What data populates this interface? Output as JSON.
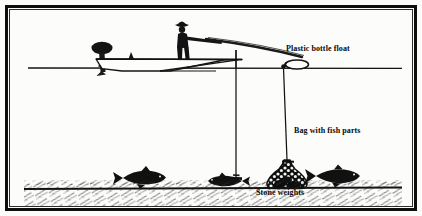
{
  "figure": {
    "domain": "diagram",
    "background_color": "#fcfcfa",
    "ink_color": "#101010",
    "frame": {
      "outer_color": "#0d0d0d",
      "inner_color": "#2a2a2a"
    }
  },
  "labels": {
    "float": "Plastic bottle float",
    "bag": "Bag with fish parts",
    "stones": "Stone weights"
  },
  "elements": {
    "boat": "fishing-boat",
    "angler": "standing-angler-with-hat",
    "motor": "outboard-motor",
    "rod": "fishing-rod",
    "fishing_line": "vertical-fishing-line",
    "hook_weight": "hook-with-small-weight",
    "float": "plastic-bottle-float",
    "mooring_line": "bag-tether-line",
    "bag": "mesh-bag-with-fish-parts",
    "stone_weights": "stone-weights-in-bag",
    "water_surface": "water-surface-line",
    "seabed": "hatched-seabed",
    "fish": [
      "fish-left",
      "fish-center",
      "fish-right"
    ]
  },
  "geometry": {
    "water_surface_y": 58,
    "seabed_y": 178,
    "float_x": 280,
    "fishing_line_x": 226,
    "bag_x": 280
  }
}
